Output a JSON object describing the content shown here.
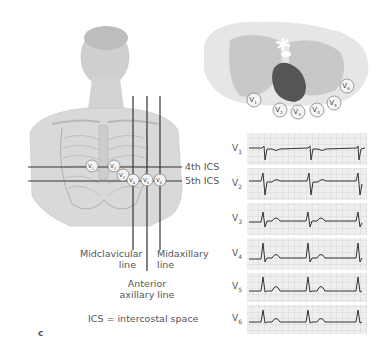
{
  "figure": {
    "panel_letter": "c",
    "legend_note": "ICS = intercostal space"
  },
  "torso": {
    "horizontal_lines": [
      {
        "label": "4th ICS"
      },
      {
        "label": "5th ICS"
      }
    ],
    "vertical_lines": [
      {
        "label_line1": "Midclavicular",
        "label_line2": "line"
      },
      {
        "label_line1": "Anterior",
        "label_line2": "axillary line"
      },
      {
        "label_line1": "Midaxillary",
        "label_line2": "line"
      }
    ],
    "electrodes": [
      "V1",
      "V2",
      "V3",
      "V4",
      "V5",
      "V6"
    ]
  },
  "cross_section": {
    "electrodes": [
      "V1",
      "V2",
      "V3",
      "V4",
      "V5",
      "V6"
    ],
    "colors": {
      "body": "#e6e6e6",
      "lung": "#c8c8c8",
      "heart": "#555555"
    }
  },
  "ecg": {
    "leads": [
      {
        "name": "V",
        "sub": "1"
      },
      {
        "name": "V",
        "sub": "2"
      },
      {
        "name": "V",
        "sub": "3"
      },
      {
        "name": "V",
        "sub": "4"
      },
      {
        "name": "V",
        "sub": "5"
      },
      {
        "name": "V",
        "sub": "6"
      }
    ],
    "grid_color": "#c8c8c8",
    "trace_color": "#333333"
  }
}
